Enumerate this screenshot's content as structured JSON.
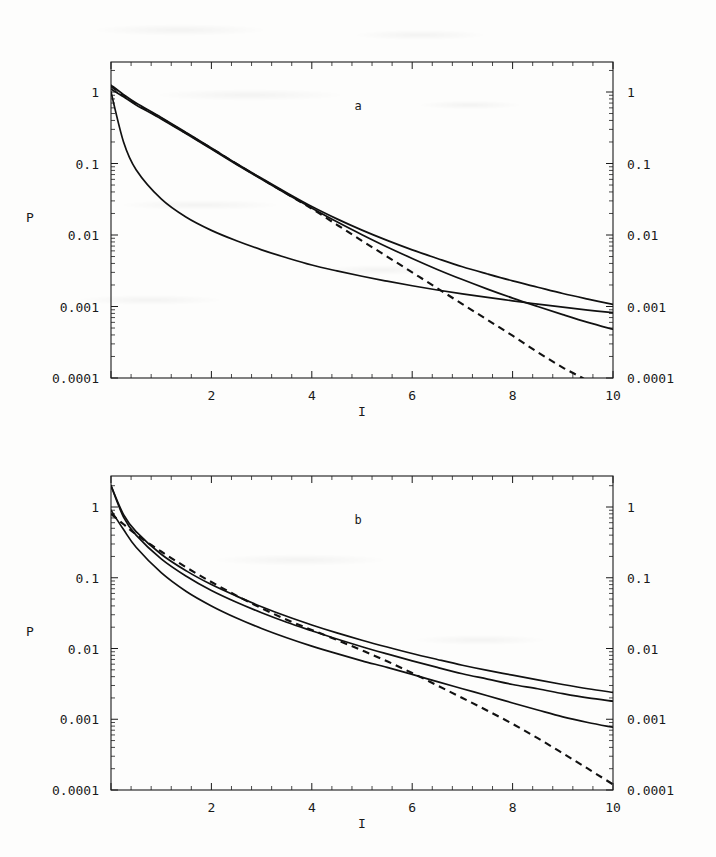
{
  "figure": {
    "background_color": "#fdfdfc",
    "ink_color": "#111111"
  },
  "chart_data": [
    {
      "type": "line",
      "title": "",
      "panel_label": "a",
      "xlabel": "I",
      "ylabel": "P",
      "xlim": [
        0,
        10
      ],
      "ylim": [
        0.0001,
        2
      ],
      "yscale": "log",
      "xscale": "linear",
      "grid": false,
      "legend": "none",
      "xticks": [
        2,
        4,
        6,
        8,
        10
      ],
      "xtick_labels": [
        "2",
        "4",
        "6",
        "8",
        "10"
      ],
      "yticks": [
        1,
        0.1,
        0.01,
        0.001,
        0.0001
      ],
      "ytick_labels": [
        "1",
        "0.1",
        "0.01",
        "0.001",
        "0.0001"
      ],
      "right_axis_tick_labels": [
        "1",
        "0.1",
        "0.01",
        "0.001",
        "0.0001"
      ],
      "x": [
        0,
        0.25,
        0.5,
        1,
        1.5,
        2,
        2.5,
        3,
        3.5,
        4,
        4.5,
        5,
        5.5,
        6,
        6.5,
        7,
        7.5,
        8,
        8.5,
        9,
        9.5,
        10
      ],
      "series": [
        {
          "name": "curve-1-upper",
          "style": "solid",
          "values": [
            1.25,
            0.92,
            0.7,
            0.44,
            0.27,
            0.165,
            0.1,
            0.062,
            0.039,
            0.025,
            0.0168,
            0.0117,
            0.0084,
            0.0062,
            0.0047,
            0.0036,
            0.00285,
            0.00228,
            0.00186,
            0.00152,
            0.00127,
            0.00107
          ]
        },
        {
          "name": "curve-2-middle",
          "style": "solid",
          "values": [
            1.1,
            0.86,
            0.66,
            0.42,
            0.26,
            0.159,
            0.097,
            0.06,
            0.0375,
            0.0238,
            0.0153,
            0.0101,
            0.0068,
            0.0047,
            0.0033,
            0.00238,
            0.00175,
            0.00131,
            0.001,
            0.00077,
            0.0006,
            0.00048
          ]
        },
        {
          "name": "curve-3-lower",
          "style": "solid",
          "values": [
            1.0,
            0.2,
            0.082,
            0.032,
            0.0177,
            0.0116,
            0.0083,
            0.0062,
            0.0048,
            0.0038,
            0.00315,
            0.00265,
            0.00226,
            0.00195,
            0.0017,
            0.0015,
            0.00134,
            0.0012,
            0.00108,
            0.00098,
            0.00089,
            0.00082
          ]
        },
        {
          "name": "curve-4-dashed-asymptote",
          "style": "dashed",
          "values": [
            1.2,
            0.9,
            0.68,
            0.43,
            0.265,
            0.163,
            0.099,
            0.061,
            0.0378,
            0.0233,
            0.0139,
            0.0083,
            0.005,
            0.003,
            0.0018,
            0.00108,
            0.00065,
            0.00039,
            0.00023,
            0.00014,
            9e-05,
            5e-05
          ]
        }
      ]
    },
    {
      "type": "line",
      "title": "",
      "panel_label": "b",
      "xlabel": "I",
      "ylabel": "P",
      "xlim": [
        0,
        10
      ],
      "ylim": [
        0.0001,
        2
      ],
      "yscale": "log",
      "xscale": "linear",
      "grid": false,
      "legend": "none",
      "xticks": [
        2,
        4,
        6,
        8,
        10
      ],
      "xtick_labels": [
        "2",
        "4",
        "6",
        "8",
        "10"
      ],
      "yticks": [
        1,
        0.1,
        0.01,
        0.001,
        0.0001
      ],
      "ytick_labels": [
        "1",
        "0.1",
        "0.01",
        "0.001",
        "0.0001"
      ],
      "right_axis_tick_labels": [
        "1",
        "0.1",
        "0.01",
        "0.001",
        "0.0001"
      ],
      "x": [
        0,
        0.25,
        0.5,
        1,
        1.5,
        2,
        2.5,
        3,
        3.5,
        4,
        4.5,
        5,
        5.5,
        6,
        6.5,
        7,
        7.5,
        8,
        8.5,
        9,
        9.5,
        10
      ],
      "series": [
        {
          "name": "curve-1-upper",
          "style": "solid",
          "values": [
            2.0,
            0.78,
            0.45,
            0.215,
            0.125,
            0.08,
            0.055,
            0.039,
            0.0285,
            0.0215,
            0.0166,
            0.0131,
            0.0105,
            0.0085,
            0.007,
            0.0058,
            0.0049,
            0.0042,
            0.0036,
            0.0031,
            0.0027,
            0.0024
          ]
        },
        {
          "name": "curve-2-middle",
          "style": "solid",
          "values": [
            2.0,
            0.72,
            0.4,
            0.185,
            0.105,
            0.066,
            0.045,
            0.032,
            0.0235,
            0.0178,
            0.0136,
            0.0106,
            0.0084,
            0.0067,
            0.0054,
            0.0044,
            0.0037,
            0.0031,
            0.0027,
            0.0023,
            0.002,
            0.0018
          ]
        },
        {
          "name": "curve-3-lower",
          "style": "solid",
          "values": [
            0.9,
            0.48,
            0.27,
            0.118,
            0.064,
            0.04,
            0.027,
            0.0192,
            0.0142,
            0.0108,
            0.00845,
            0.0067,
            0.0054,
            0.0043,
            0.0034,
            0.0027,
            0.00215,
            0.0017,
            0.00135,
            0.00108,
            0.0009,
            0.00077
          ]
        },
        {
          "name": "curve-4-dashed-asymptote",
          "style": "dashed",
          "values": [
            0.8,
            0.57,
            0.41,
            0.235,
            0.14,
            0.087,
            0.056,
            0.037,
            0.0255,
            0.0183,
            0.0132,
            0.0094,
            0.0066,
            0.0045,
            0.003,
            0.002,
            0.00132,
            0.00086,
            0.00054,
            0.00033,
            0.0002,
            0.00012
          ]
        }
      ]
    }
  ],
  "panels": [
    {
      "id": "panel-a",
      "letter": "a",
      "ylabel": "P",
      "xlabel": "I",
      "left_ytick_labels": [
        "1",
        "0.1",
        "0.01",
        "0.001",
        "0.0001"
      ],
      "right_ytick_labels": [
        "1",
        "0.1",
        "0.01",
        "0.001",
        "0.0001"
      ],
      "xtick_labels": [
        "2",
        "4",
        "6",
        "8",
        "10"
      ]
    },
    {
      "id": "panel-b",
      "letter": "b",
      "ylabel": "P",
      "xlabel": "I",
      "left_ytick_labels": [
        "1",
        "0.1",
        "0.01",
        "0.001",
        "0.0001"
      ],
      "right_ytick_labels": [
        "1",
        "0.1",
        "0.01",
        "0.001",
        "0.0001"
      ],
      "xtick_labels": [
        "2",
        "4",
        "6",
        "8",
        "10"
      ]
    }
  ]
}
